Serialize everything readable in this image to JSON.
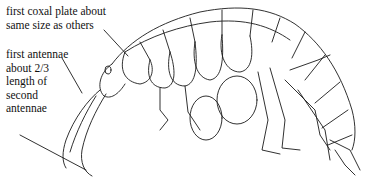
{
  "figure": {
    "annotations": [
      {
        "id": "coxal",
        "lines": [
          "first coxal plate about",
          "same size as others"
        ]
      },
      {
        "id": "antennae",
        "lines": [
          "first antennae",
          "about 2/3",
          "length of",
          "second",
          "antennae"
        ]
      }
    ]
  },
  "labels": {
    "coxal_text": "first coxal plate about\nsame size as others",
    "antennae_text": "first antennae\nabout 2/3\nlength of\nsecond\nantennae"
  },
  "colors": {
    "background": "#ffffff",
    "ink": "#1a1a1a"
  }
}
